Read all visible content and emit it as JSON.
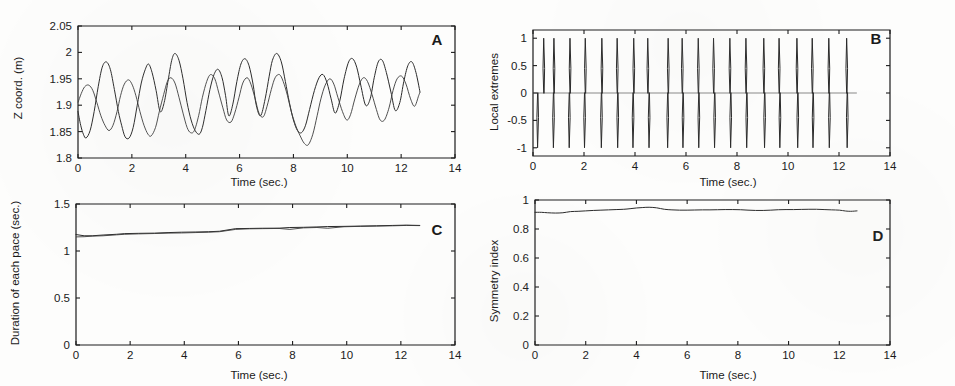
{
  "figure": {
    "background_color": "#fdfdfc",
    "line_color": "#2a2a2a",
    "panel_count": 4
  },
  "chart_data": [
    {
      "type": "line",
      "panel": "A",
      "title": "",
      "xlabel": "Time (sec.)",
      "ylabel": "Z coord. (m)",
      "xlim": [
        0,
        14
      ],
      "ylim": [
        1.8,
        2.05
      ],
      "xticks": [
        0,
        2,
        4,
        6,
        8,
        10,
        12,
        14
      ],
      "xticklabels": [
        "0",
        "2",
        "4",
        "6",
        "8",
        "10",
        "12",
        "14"
      ],
      "yticks": [
        1.8,
        1.85,
        1.9,
        1.95,
        2,
        2.05
      ],
      "yticklabels": [
        "1.8",
        "1.85",
        "1.9",
        "1.95",
        "2",
        "2.05"
      ],
      "grid": false,
      "legend": null,
      "series": [
        {
          "name": "marker-1",
          "x": [
            0.0,
            0.1,
            0.2,
            0.3,
            0.45,
            0.6,
            0.75,
            0.9,
            1.05,
            1.2,
            1.35,
            1.5,
            1.62,
            1.75,
            1.9,
            2.05,
            2.2,
            2.35,
            2.5,
            2.62,
            2.75,
            2.9,
            3.05,
            3.2,
            3.35,
            3.48,
            3.6,
            3.75,
            3.9,
            4.05,
            4.2,
            4.35,
            4.5,
            4.62,
            4.75,
            4.9,
            5.05,
            5.2,
            5.35,
            5.48,
            5.6,
            5.75,
            5.9,
            6.05,
            6.2,
            6.35,
            6.5,
            6.62,
            6.78,
            6.95,
            7.1,
            7.22,
            7.38,
            7.55,
            7.7,
            7.85,
            8.0,
            8.15,
            8.3,
            8.45,
            8.6,
            8.78,
            8.95,
            9.1,
            9.25,
            9.4,
            9.55,
            9.72,
            9.88,
            10.05,
            10.2,
            10.35,
            10.5,
            10.68,
            10.85,
            11.0,
            11.15,
            11.3,
            11.45,
            11.62,
            11.78,
            11.95,
            12.1,
            12.25,
            12.4,
            12.55,
            12.7
          ],
          "y": [
            1.888,
            1.862,
            1.845,
            1.838,
            1.852,
            1.888,
            1.935,
            1.972,
            1.982,
            1.968,
            1.93,
            1.888,
            1.862,
            1.84,
            1.838,
            1.858,
            1.9,
            1.942,
            1.968,
            1.978,
            1.962,
            1.928,
            1.888,
            1.905,
            1.948,
            1.985,
            1.998,
            1.985,
            1.95,
            1.905,
            1.872,
            1.852,
            1.845,
            1.858,
            1.89,
            1.93,
            1.958,
            1.968,
            1.952,
            1.918,
            1.88,
            1.902,
            1.945,
            1.978,
            1.988,
            1.975,
            1.94,
            1.9,
            1.88,
            1.912,
            1.955,
            1.985,
            1.998,
            1.982,
            1.945,
            1.905,
            1.872,
            1.852,
            1.848,
            1.862,
            1.892,
            1.928,
            1.952,
            1.958,
            1.942,
            1.912,
            1.885,
            1.908,
            1.95,
            1.982,
            1.988,
            1.972,
            1.938,
            1.9,
            1.912,
            1.952,
            1.982,
            1.985,
            1.962,
            1.925,
            1.89,
            1.905,
            1.945,
            1.975,
            1.982,
            1.962,
            1.925
          ],
          "color": "#2a2a2a"
        },
        {
          "name": "marker-2",
          "x": [
            0.0,
            0.12,
            0.25,
            0.4,
            0.55,
            0.7,
            0.85,
            1.0,
            1.15,
            1.3,
            1.45,
            1.58,
            1.72,
            1.88,
            2.02,
            2.15,
            2.3,
            2.45,
            2.6,
            2.72,
            2.88,
            3.02,
            3.18,
            3.32,
            3.45,
            3.6,
            3.75,
            3.9,
            4.05,
            4.18,
            4.32,
            4.48,
            4.62,
            4.78,
            4.92,
            5.08,
            5.22,
            5.38,
            5.52,
            5.68,
            5.82,
            5.98,
            6.12,
            6.28,
            6.42,
            6.58,
            6.72,
            6.88,
            7.02,
            7.18,
            7.32,
            7.48,
            7.62,
            7.78,
            7.92,
            8.08,
            8.25,
            8.4,
            8.55,
            8.72,
            8.88,
            9.02,
            9.18,
            9.35,
            9.5,
            9.65,
            9.82,
            9.98,
            10.12,
            10.28,
            10.45,
            10.6,
            10.75,
            10.92,
            11.08,
            11.22,
            11.38,
            11.55,
            11.7,
            11.85,
            12.02,
            12.18,
            12.35,
            12.5,
            12.65,
            12.7
          ],
          "y": [
            1.905,
            1.922,
            1.935,
            1.938,
            1.928,
            1.905,
            1.88,
            1.862,
            1.852,
            1.862,
            1.888,
            1.918,
            1.94,
            1.948,
            1.938,
            1.918,
            1.888,
            1.862,
            1.845,
            1.842,
            1.858,
            1.888,
            1.92,
            1.945,
            1.952,
            1.942,
            1.915,
            1.885,
            1.858,
            1.848,
            1.852,
            1.88,
            1.915,
            1.945,
            1.958,
            1.95,
            1.925,
            1.895,
            1.872,
            1.868,
            1.885,
            1.915,
            1.942,
            1.952,
            1.94,
            1.912,
            1.885,
            1.878,
            1.898,
            1.93,
            1.952,
            1.958,
            1.945,
            1.918,
            1.888,
            1.862,
            1.842,
            1.828,
            1.825,
            1.845,
            1.88,
            1.912,
            1.938,
            1.95,
            1.94,
            1.915,
            1.888,
            1.872,
            1.882,
            1.912,
            1.94,
            1.952,
            1.945,
            1.92,
            1.892,
            1.872,
            1.872,
            1.895,
            1.928,
            1.95,
            1.955,
            1.94,
            1.912,
            1.898,
            1.918,
            1.925
          ],
          "color": "#3a3a3a"
        }
      ]
    },
    {
      "type": "line",
      "panel": "B",
      "title": "",
      "xlabel": "Time (sec.)",
      "ylabel": "Local extremes",
      "xlim": [
        0,
        14
      ],
      "ylim": [
        -1.15,
        1.15
      ],
      "xticks": [
        0,
        2,
        4,
        6,
        8,
        10,
        12,
        14
      ],
      "xticklabels": [
        "0",
        "2",
        "4",
        "6",
        "8",
        "10",
        "12",
        "14"
      ],
      "yticks": [
        -1,
        -0.5,
        0,
        0.5,
        1
      ],
      "yticklabels": [
        "-1",
        "-0.5",
        "0",
        "0.5",
        "1"
      ],
      "grid": false,
      "legend": null,
      "description": "alternating impulse spikes at detected local maxima (+1) and minima (-1)",
      "spikes_positive_times": [
        0.42,
        0.82,
        1.45,
        2.05,
        2.7,
        3.3,
        3.95,
        4.5,
        5.3,
        5.85,
        6.48,
        7.08,
        7.72,
        8.35,
        9.05,
        9.65,
        10.35,
        10.95,
        11.6,
        12.3
      ],
      "spikes_negative_times": [
        0.18,
        0.8,
        1.42,
        2.02,
        2.68,
        3.32,
        3.92,
        4.55,
        5.28,
        5.88,
        6.5,
        7.12,
        7.75,
        8.38,
        9.08,
        9.68,
        10.38,
        10.98,
        11.62,
        12.32
      ],
      "spike_amplitude": 1.0
    },
    {
      "type": "line",
      "panel": "C",
      "title": "",
      "xlabel": "Time (sec.)",
      "ylabel": "Duration of each pace (sec.)",
      "xlim": [
        0,
        14
      ],
      "ylim": [
        0,
        1.5
      ],
      "xticks": [
        0,
        2,
        4,
        6,
        8,
        10,
        12,
        14
      ],
      "xticklabels": [
        "0",
        "2",
        "4",
        "6",
        "8",
        "10",
        "12",
        "14"
      ],
      "yticks": [
        0,
        0.5,
        1,
        1.5
      ],
      "yticklabels": [
        "0",
        "0.5",
        "1",
        "1.5"
      ],
      "grid": false,
      "legend": null,
      "series": [
        {
          "name": "pace-left",
          "x": [
            0.0,
            0.3,
            0.6,
            1.0,
            1.5,
            1.8,
            2.3,
            2.9,
            3.4,
            3.9,
            4.4,
            4.9,
            5.3,
            5.9,
            6.4,
            6.9,
            7.5,
            7.9,
            8.4,
            8.9,
            9.3,
            9.9,
            10.5,
            11.1,
            11.7,
            12.2,
            12.7
          ],
          "y": [
            1.175,
            1.162,
            1.162,
            1.17,
            1.178,
            1.185,
            1.188,
            1.19,
            1.196,
            1.2,
            1.202,
            1.205,
            1.21,
            1.238,
            1.24,
            1.242,
            1.243,
            1.25,
            1.252,
            1.256,
            1.26,
            1.262,
            1.265,
            1.268,
            1.272,
            1.275,
            1.272
          ],
          "color": "#2a2a2a"
        },
        {
          "name": "pace-right",
          "x": [
            0.0,
            0.3,
            0.6,
            1.0,
            1.5,
            1.8,
            2.3,
            2.9,
            3.4,
            3.9,
            4.4,
            4.9,
            5.3,
            5.9,
            6.4,
            6.9,
            7.5,
            7.9,
            8.4,
            8.9,
            9.3,
            9.9,
            10.5,
            11.1,
            11.7,
            12.2,
            12.7
          ],
          "y": [
            1.15,
            1.152,
            1.158,
            1.162,
            1.172,
            1.178,
            1.182,
            1.186,
            1.19,
            1.192,
            1.196,
            1.2,
            1.205,
            1.23,
            1.236,
            1.238,
            1.24,
            1.23,
            1.246,
            1.25,
            1.242,
            1.258,
            1.262,
            1.265,
            1.268,
            1.272,
            1.27
          ],
          "color": "#3a3a3a"
        }
      ]
    },
    {
      "type": "line",
      "panel": "D",
      "title": "",
      "xlabel": "Time (sec.)",
      "ylabel": "Symmetry index",
      "xlim": [
        0,
        14
      ],
      "ylim": [
        0,
        1
      ],
      "xticks": [
        0,
        2,
        4,
        6,
        8,
        10,
        12,
        14
      ],
      "xticklabels": [
        "0",
        "2",
        "4",
        "6",
        "8",
        "10",
        "12",
        "14"
      ],
      "yticks": [
        0,
        0.2,
        0.4,
        0.6,
        0.8,
        1
      ],
      "yticklabels": [
        "0",
        "0.2",
        "0.4",
        "0.6",
        "0.8",
        "1"
      ],
      "grid": false,
      "legend": null,
      "series": [
        {
          "name": "symmetry-index",
          "x": [
            0.0,
            0.25,
            0.5,
            0.8,
            1.1,
            1.4,
            1.7,
            2.0,
            2.3,
            2.6,
            2.9,
            3.2,
            3.5,
            3.75,
            4.0,
            4.25,
            4.5,
            4.8,
            5.1,
            5.4,
            5.7,
            6.0,
            6.3,
            6.6,
            6.9,
            7.2,
            7.5,
            7.8,
            8.1,
            8.4,
            8.7,
            9.0,
            9.3,
            9.6,
            9.9,
            10.2,
            10.5,
            10.8,
            11.1,
            11.4,
            11.7,
            12.0,
            12.25,
            12.45,
            12.7
          ],
          "y": [
            0.915,
            0.915,
            0.912,
            0.91,
            0.912,
            0.92,
            0.922,
            0.925,
            0.928,
            0.93,
            0.932,
            0.934,
            0.936,
            0.94,
            0.945,
            0.948,
            0.95,
            0.946,
            0.936,
            0.932,
            0.93,
            0.93,
            0.931,
            0.932,
            0.932,
            0.933,
            0.934,
            0.934,
            0.933,
            0.93,
            0.928,
            0.928,
            0.93,
            0.933,
            0.934,
            0.934,
            0.935,
            0.936,
            0.936,
            0.934,
            0.932,
            0.93,
            0.924,
            0.922,
            0.925
          ],
          "color": "#2a2a2a"
        }
      ]
    }
  ],
  "panels": [
    {
      "letter": "A",
      "ylabel": "Z coord. (m)",
      "xlabel": "Time (sec.)"
    },
    {
      "letter": "B",
      "ylabel": "Local extremes",
      "xlabel": "Time (sec.)"
    },
    {
      "letter": "C",
      "ylabel": "Duration of each pace (sec.)",
      "xlabel": "Time (sec.)"
    },
    {
      "letter": "D",
      "ylabel": "Symmetry index",
      "xlabel": "Time (sec.)"
    }
  ]
}
